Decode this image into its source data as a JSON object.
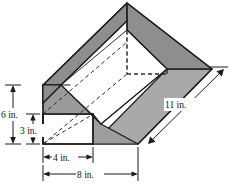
{
  "figure": {
    "kind": "geometry-diagram",
    "colors": {
      "outline": "#1a1a1a",
      "face_dark": "#8d8d8d",
      "face_mid": "#a6a6a6",
      "face_light": "#c2c2c2",
      "face_white": "#ffffff",
      "hidden_edge": "#333333",
      "background": "#ffffff"
    },
    "dimensions": [
      {
        "id": "height-total",
        "label": "6 in.",
        "value": 6,
        "unit": "in.",
        "orientation": "vertical",
        "position": "left-outer"
      },
      {
        "id": "height-lower",
        "label": "3 in.",
        "value": 3,
        "unit": "in.",
        "orientation": "vertical",
        "position": "left-inner"
      },
      {
        "id": "width-inner",
        "label": "4 in.",
        "value": 4,
        "unit": "in.",
        "orientation": "horizontal",
        "position": "bottom-inner"
      },
      {
        "id": "width-total",
        "label": "8 in.",
        "value": 8,
        "unit": "in.",
        "orientation": "horizontal",
        "position": "bottom-outer"
      },
      {
        "id": "depth",
        "label": "11 in.",
        "value": 11,
        "unit": "in.",
        "orientation": "diagonal",
        "position": "right-outer"
      }
    ]
  }
}
